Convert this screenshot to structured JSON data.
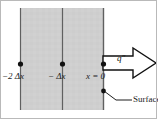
{
  "figure": {
    "canvas": {
      "width": 158,
      "height": 120
    },
    "colors": {
      "medium_fill": "#cfcfcf",
      "grid_line": "#606060",
      "node_dot": "#111111",
      "arrow_outline": "#111111",
      "arrow_fill": "#ffffff",
      "text": "#1c1c1c",
      "frame": "#b9b9b9",
      "background": "#ffffff"
    },
    "medium": {
      "name": "solid-medium-region",
      "x": 20,
      "y": 8,
      "width": 83,
      "height": 102
    },
    "gridlines": [
      {
        "name": "gridline-minus-2dx",
        "x": 20
      },
      {
        "name": "gridline-minus-dx",
        "x": 62
      },
      {
        "name": "gridline-surface",
        "x": 103
      }
    ],
    "nodes": [
      {
        "name": "node-minus-2dx",
        "cx": 20,
        "cy": 64,
        "label_prefix": "−2",
        "label_symbol": "Δx",
        "label_text": "−2 Δx",
        "label_x": 2,
        "label_y": 72
      },
      {
        "name": "node-minus-dx",
        "cx": 62,
        "cy": 64,
        "label_prefix": "−",
        "label_symbol": "Δx",
        "label_text": "− Δx",
        "label_x": 48,
        "label_y": 72
      },
      {
        "name": "node-surface",
        "cx": 103,
        "cy": 64,
        "label_prefix": "x",
        "label_symbol": "= 0",
        "label_text": "x = 0",
        "label_x": 86,
        "label_y": 72
      }
    ],
    "flux_arrow": {
      "name": "heat-flux-arrow",
      "label": "q″",
      "label_x": 117,
      "label_y": 55,
      "direction": "right",
      "tail_x": 103,
      "tip_x": 156,
      "center_y": 63,
      "shaft_half_height": 7,
      "head_half_height": 15,
      "head_start_x": 133
    },
    "callout": {
      "name": "surface-callout",
      "label": "Surface",
      "label_x": 118,
      "label_y": 95,
      "point_x": 104,
      "point_y": 91,
      "elbow_x": 115,
      "elbow_y": 99,
      "dot_cx": 103,
      "dot_cy": 91
    }
  }
}
